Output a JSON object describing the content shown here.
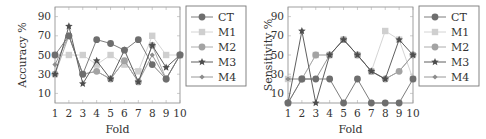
{
  "chart_data": [
    {
      "type": "line",
      "title": "",
      "xlabel": "Fold",
      "ylabel": "Accuracy %",
      "x": [
        1,
        2,
        3,
        4,
        5,
        6,
        7,
        8,
        9,
        10
      ],
      "xticks": [
        "1",
        "2",
        "3",
        "4",
        "5",
        "6",
        "7",
        "8",
        "9",
        "10"
      ],
      "yticks": [
        "10",
        "30",
        "50",
        "70",
        "90"
      ],
      "ylim": [
        0,
        100
      ],
      "xlim": [
        1,
        10
      ],
      "grid": false,
      "legend_position": "right",
      "series": [
        {
          "name": "CT",
          "marker": "circle",
          "color": "#6e6e6e",
          "line": true,
          "values": [
            50,
            70,
            30,
            66,
            62,
            55,
            66,
            40,
            25,
            50
          ]
        },
        {
          "name": "M1",
          "marker": "square",
          "color": "#cfcfcf",
          "line": true,
          "values": [
            50,
            50,
            50,
            40,
            50,
            40,
            33,
            70,
            50,
            50
          ]
        },
        {
          "name": "M2",
          "marker": "circle",
          "color": "#a3a3a3",
          "line": true,
          "values": [
            30,
            70,
            30,
            33,
            25,
            44,
            22,
            60,
            25,
            50
          ]
        },
        {
          "name": "M3",
          "marker": "star",
          "color": "#4d4d4d",
          "line": true,
          "values": [
            30,
            80,
            20,
            44,
            25,
            55,
            22,
            60,
            37,
            50
          ]
        },
        {
          "name": "M4",
          "marker": "diamond",
          "color": "#8c8c8c",
          "line": true,
          "values": [
            40,
            70,
            30,
            33,
            25,
            44,
            22,
            50,
            25,
            50
          ]
        }
      ]
    },
    {
      "type": "line",
      "title": "",
      "xlabel": "Fold",
      "ylabel": "Sensitivity %",
      "x": [
        1,
        2,
        3,
        4,
        5,
        6,
        7,
        8,
        9,
        10
      ],
      "xticks": [
        "1",
        "2",
        "3",
        "4",
        "5",
        "6",
        "7",
        "8",
        "9",
        "10"
      ],
      "yticks": [
        "10",
        "30",
        "50",
        "70",
        "90"
      ],
      "ylim": [
        0,
        100
      ],
      "xlim": [
        1,
        10
      ],
      "grid": false,
      "legend_position": "right",
      "series": [
        {
          "name": "CT",
          "marker": "circle",
          "color": "#6e6e6e",
          "line": true,
          "values": [
            0,
            25,
            25,
            25,
            0,
            25,
            0,
            0,
            0,
            25
          ]
        },
        {
          "name": "M1",
          "marker": "square",
          "color": "#cfcfcf",
          "line": true,
          "values": [
            25,
            25,
            50,
            50,
            66,
            50,
            33,
            75,
            66,
            25
          ]
        },
        {
          "name": "M2",
          "marker": "circle",
          "color": "#a3a3a3",
          "line": true,
          "values": [
            0,
            25,
            50,
            50,
            66,
            50,
            33,
            25,
            33,
            50
          ]
        },
        {
          "name": "M3",
          "marker": "star",
          "color": "#4d4d4d",
          "line": true,
          "values": [
            0,
            75,
            0,
            50,
            66,
            50,
            33,
            25,
            66,
            50
          ]
        },
        {
          "name": "M4",
          "marker": "diamond",
          "color": "#8c8c8c",
          "line": true,
          "values": [
            25,
            25,
            25,
            50,
            66,
            50,
            33,
            25,
            33,
            50
          ]
        }
      ]
    }
  ]
}
